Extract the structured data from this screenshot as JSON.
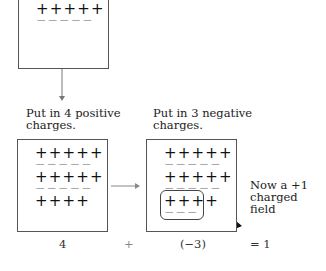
{
  "top_box": {
    "plus_rows": [
      "+++++"
    ],
    "minus_rows": [
      "−−−−−"
    ]
  },
  "left_box": {
    "caption_line1": "Put in 4 positive",
    "caption_line2": "charges.",
    "rows": [
      {
        "type": "plus",
        "text": "+++++"
      },
      {
        "type": "minus",
        "text": "−−−−−"
      },
      {
        "type": "plus",
        "text": "+++++"
      },
      {
        "type": "minus",
        "text": "−−−−−"
      },
      {
        "type": "plus",
        "text": "++++"
      }
    ]
  },
  "right_box": {
    "caption_line1": "Put in 3 negative",
    "caption_line2": "charges.",
    "rows": [
      {
        "type": "plus",
        "text": "+++++"
      },
      {
        "type": "minus",
        "text": "−−−−−"
      },
      {
        "type": "plus",
        "text": "+++++"
      },
      {
        "type": "minus",
        "text": "−−−−−"
      },
      {
        "type": "plus",
        "text": "++++"
      },
      {
        "type": "minus",
        "text": "−−−"
      }
    ]
  },
  "annotation": {
    "line1": "Now a +1",
    "line2": "charged field"
  },
  "equation": {
    "term1": "4",
    "op1": "+",
    "term2": "(−3)",
    "result": "= 1"
  }
}
